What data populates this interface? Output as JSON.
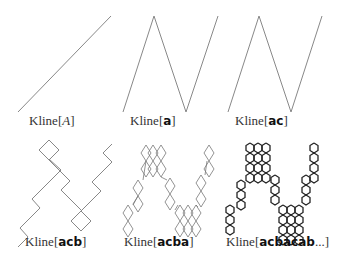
{
  "figure": {
    "panels": [
      {
        "id": "A",
        "prefix": "Kline[",
        "arg": "A",
        "arg_style": "italic",
        "suffix": "]"
      },
      {
        "id": "a",
        "prefix": "Kline[",
        "arg": "a",
        "arg_style": "bold",
        "suffix": "]"
      },
      {
        "id": "ac",
        "prefix": "Kline[",
        "arg": "ac",
        "arg_style": "bold",
        "suffix": "]"
      },
      {
        "id": "acb",
        "prefix": "Kline[",
        "arg": "acb",
        "arg_style": "bold",
        "suffix": "]"
      },
      {
        "id": "acba",
        "prefix": "Kline[",
        "arg": "acba",
        "arg_style": "bold",
        "suffix": "]"
      },
      {
        "id": "acbacab",
        "prefix": "Kline[",
        "arg": "acbacab",
        "arg_style": "bold",
        "suffix": "...]"
      }
    ],
    "line_color": "#777777",
    "dense_line_color": "#222222"
  }
}
